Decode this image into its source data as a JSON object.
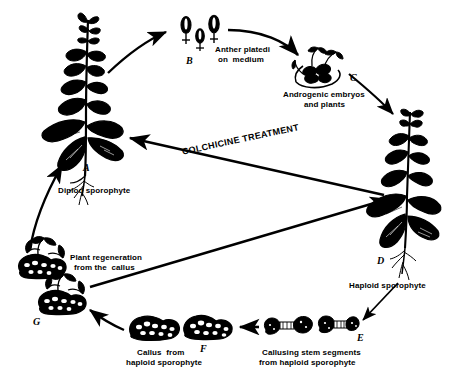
{
  "diagram": {
    "background_color": "#ffffff",
    "ink_color": "#000000",
    "width": 454,
    "height": 388
  },
  "stages": {
    "a": {
      "letter": "A",
      "caption": "Diplod sporophyte",
      "icon": "flowering-plant-icon"
    },
    "b": {
      "letter": "B",
      "caption_line1": "Anther platedi",
      "caption_line2": "on  medium",
      "icon": "anther-icon"
    },
    "c": {
      "letter": "C",
      "caption_line1": "Androgenic embryos",
      "caption_line2": "and plants",
      "icon": "embryo-cluster-icon"
    },
    "d": {
      "letter": "D",
      "caption": "Haploid sporophyte",
      "icon": "haploid-plant-icon"
    },
    "e": {
      "letter": "E",
      "caption_line1": "Callusing stem segments",
      "caption_line2": "from haploid sporophyte",
      "icon": "callusing-stem-segment-icon"
    },
    "f": {
      "letter": "F",
      "caption_line1": "Callus  from",
      "caption_line2": "haploid sporophyte",
      "icon": "callus-mass-icon"
    },
    "g": {
      "letter": "G",
      "caption_line1": "Plant regeneration",
      "caption_line2": "from the  callus",
      "icon": "regenerating-plantlet-icon"
    }
  },
  "treatment": {
    "label": "COLCHICINE TREATMENT"
  },
  "arrows": [
    {
      "name": "arrow-a-to-b",
      "from": "A",
      "to": "B"
    },
    {
      "name": "arrow-b-to-c",
      "from": "B",
      "to": "C"
    },
    {
      "name": "arrow-c-to-d",
      "from": "C",
      "to": "D"
    },
    {
      "name": "arrow-d-to-a-colchicine",
      "from": "D",
      "to": "A"
    },
    {
      "name": "arrow-d-to-e",
      "from": "D",
      "to": "E"
    },
    {
      "name": "arrow-e-to-f",
      "from": "E",
      "to": "F"
    },
    {
      "name": "arrow-f-to-g",
      "from": "F",
      "to": "G"
    },
    {
      "name": "arrow-g-to-d",
      "from": "G",
      "to": "D"
    },
    {
      "name": "arrow-g-to-a",
      "from": "G",
      "to": "A"
    }
  ]
}
